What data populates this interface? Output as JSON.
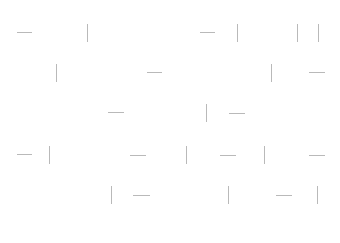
{
  "canvas": {
    "width": 340,
    "height": 243,
    "background": "#ffffff",
    "stroke_color": "#b9b9b9"
  },
  "marks": [
    {
      "type": "dash",
      "x": 17,
      "y": 32,
      "len": 15
    },
    {
      "type": "bar",
      "x": 87,
      "y": 24,
      "len": 18
    },
    {
      "type": "dash",
      "x": 200,
      "y": 32,
      "len": 15
    },
    {
      "type": "bar",
      "x": 237,
      "y": 24,
      "len": 18
    },
    {
      "type": "bar",
      "x": 297,
      "y": 24,
      "len": 18
    },
    {
      "type": "bar",
      "x": 318,
      "y": 24,
      "len": 18
    },
    {
      "type": "bar",
      "x": 56,
      "y": 64,
      "len": 18
    },
    {
      "type": "dash",
      "x": 147,
      "y": 72,
      "len": 15
    },
    {
      "type": "bar",
      "x": 271,
      "y": 64,
      "len": 18
    },
    {
      "type": "dash",
      "x": 309,
      "y": 72,
      "len": 16
    },
    {
      "type": "dash",
      "x": 108,
      "y": 112,
      "len": 16
    },
    {
      "type": "bar",
      "x": 206,
      "y": 104,
      "len": 18
    },
    {
      "type": "dash",
      "x": 229,
      "y": 113,
      "len": 16
    },
    {
      "type": "dash",
      "x": 17,
      "y": 154,
      "len": 15
    },
    {
      "type": "bar",
      "x": 49,
      "y": 146,
      "len": 18
    },
    {
      "type": "dash",
      "x": 130,
      "y": 155,
      "len": 16
    },
    {
      "type": "bar",
      "x": 186,
      "y": 146,
      "len": 18
    },
    {
      "type": "dash",
      "x": 220,
      "y": 155,
      "len": 16
    },
    {
      "type": "bar",
      "x": 264,
      "y": 146,
      "len": 18
    },
    {
      "type": "dash",
      "x": 309,
      "y": 155,
      "len": 16
    },
    {
      "type": "bar",
      "x": 111,
      "y": 186,
      "len": 18
    },
    {
      "type": "dash",
      "x": 133,
      "y": 195,
      "len": 17
    },
    {
      "type": "bar",
      "x": 228,
      "y": 186,
      "len": 18
    },
    {
      "type": "dash",
      "x": 276,
      "y": 195,
      "len": 16
    },
    {
      "type": "bar",
      "x": 317,
      "y": 186,
      "len": 18
    }
  ]
}
